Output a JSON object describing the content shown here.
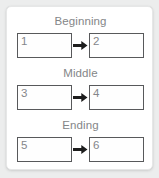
{
  "card": {
    "background_color": "#ffffff",
    "page_background_color": "#eceded"
  },
  "colors": {
    "label_text": "#848688",
    "box_border": "#58595b",
    "box_number_text": "#84868a",
    "arrow": "#1d1d1d"
  },
  "groups": [
    {
      "label": "Beginning",
      "arrow_icon": "arrow-right-icon",
      "boxes": [
        {
          "number": "1"
        },
        {
          "number": "2"
        }
      ]
    },
    {
      "label": "Middle",
      "arrow_icon": "arrow-right-icon",
      "boxes": [
        {
          "number": "3"
        },
        {
          "number": "4"
        }
      ]
    },
    {
      "label": "Ending",
      "arrow_icon": "arrow-right-icon",
      "boxes": [
        {
          "number": "5"
        },
        {
          "number": "6"
        }
      ]
    }
  ]
}
